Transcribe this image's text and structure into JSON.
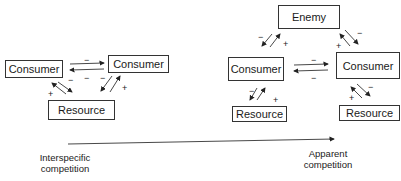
{
  "left_diagram": {
    "consumer_a": "Consumer",
    "consumer_b": "Consumer",
    "resource": "Resource",
    "signs": {
      "top_minus": "−",
      "mid_minus_left": "−",
      "mid_minus_center": "−",
      "mid_minus_right": "−",
      "plus_left": "+",
      "plus_right": "+"
    }
  },
  "right_diagram": {
    "enemy": "Enemy",
    "consumer_a": "Consumer",
    "consumer_b": "Consumer",
    "resource_a": "Resource",
    "resource_b": "Resource",
    "signs": {
      "enemy_left_minus": "−",
      "enemy_left_plus": "+",
      "enemy_right_minus": "−",
      "enemy_right_plus": "+",
      "mid_top_minus": "−",
      "mid_bottom_minus": "−",
      "res_left_minus": "−",
      "res_left_plus": "+",
      "res_right_minus": "−",
      "res_right_plus": "+"
    }
  },
  "axis": {
    "start_label_line1": "Interspecific",
    "start_label_line2": "competition",
    "end_label_line1": "Apparent",
    "end_label_line2": "competition"
  }
}
